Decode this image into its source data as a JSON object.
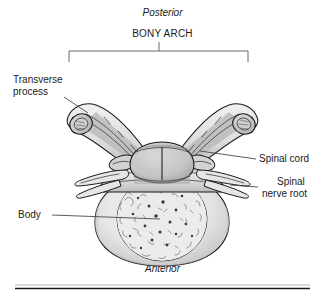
{
  "figure": {
    "title_top": "Posterior",
    "title_bottom": "Anterior",
    "group_label": "BONY ARCH"
  },
  "labels": [
    {
      "id": "transverse-process",
      "text_line1": "Transverse",
      "text_line2": "process",
      "side": "left"
    },
    {
      "id": "body",
      "text_line1": "Body",
      "text_line2": "",
      "side": "left"
    },
    {
      "id": "spinal-cord",
      "text_line1": "Spinal cord",
      "text_line2": "",
      "side": "right"
    },
    {
      "id": "spinal-nerve-root",
      "text_line1": "Spinal",
      "text_line2": "nerve root",
      "side": "right"
    }
  ],
  "colors": {
    "ink": "#1b1b1b",
    "leader": "#4a4a4a",
    "bone_light": "#ededed",
    "bone_mid": "#d8d8d8",
    "bone_shadow": "#b4b4b4",
    "cord_fill": "#c9c9c9",
    "trabecular_fill": "#ececec",
    "rule": "#1a1a1a",
    "background": "#ffffff"
  }
}
